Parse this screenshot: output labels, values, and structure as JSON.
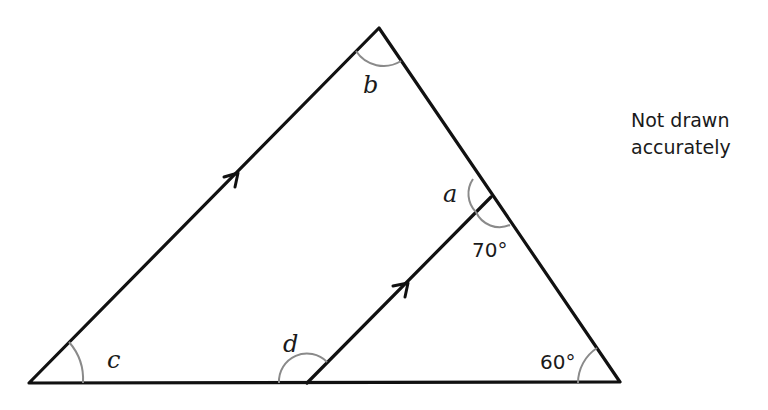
{
  "diagram": {
    "type": "geometry-triangle-with-parallel-line",
    "labels": {
      "a": "a",
      "b": "b",
      "c": "c",
      "d": "d",
      "angle_70": "70°",
      "angle_60": "60°"
    },
    "note": {
      "line1": "Not drawn",
      "line2": "accurately"
    },
    "known_angles_deg": {
      "inner_right": 70,
      "bottom_right": 60
    },
    "unknown_angles": [
      "a",
      "b",
      "c",
      "d"
    ],
    "parallel_marks": 2
  }
}
